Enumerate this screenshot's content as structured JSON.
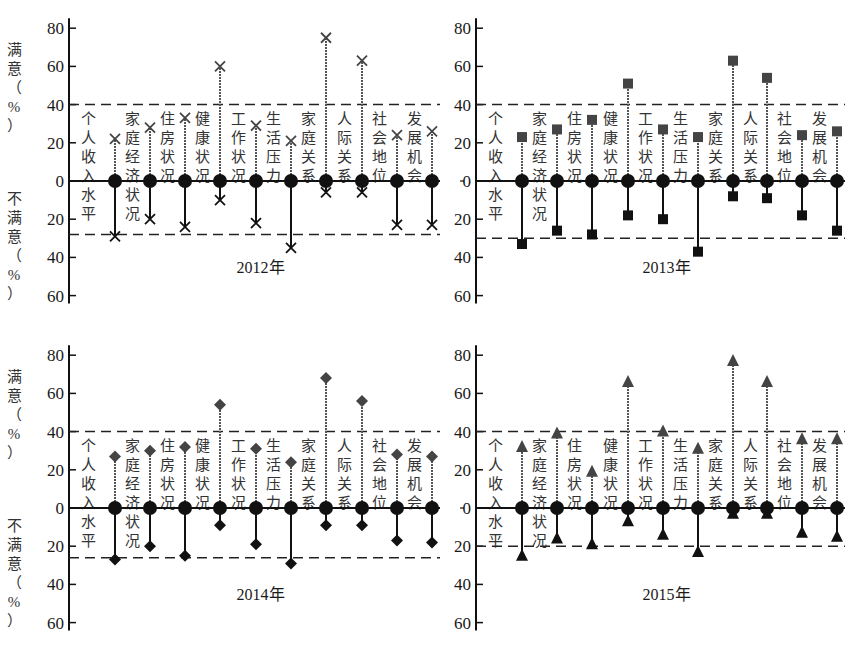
{
  "figure": {
    "colors": {
      "axis": "#111111",
      "satisfied_marker": "#444444",
      "satisfied_stem": "#555555",
      "dissatisfied_marker": "#111111",
      "dissatisfied_stem": "#111111",
      "dashed": "#222222",
      "text": "#1a1a1a"
    },
    "y_label_satisfied": [
      "满",
      "意",
      "（",
      "%",
      "）"
    ],
    "y_label_dissatisfied": [
      "不",
      "满",
      "意",
      "（",
      "%",
      "）"
    ]
  },
  "chart_data": [
    {
      "type": "bar",
      "subtype": "diverging-lollipop",
      "title": "2012年",
      "marker": "x",
      "categories": [
        "个人收入水平",
        "家庭经济状况",
        "住房状况",
        "健康状况",
        "工作状况",
        "生活压力",
        "家庭关系",
        "人际关系",
        "社会地位",
        "发展机会"
      ],
      "series": [
        {
          "name": "满意（%）",
          "values": [
            22,
            28,
            33,
            60,
            29,
            21,
            75,
            63,
            24,
            26
          ]
        },
        {
          "name": "不满意（%）",
          "values": [
            29,
            20,
            24,
            10,
            22,
            35,
            6,
            6,
            23,
            23
          ]
        }
      ],
      "reference_lines": {
        "satisfied": 40,
        "dissatisfied": 28
      },
      "ylabel_top": "满意（%）",
      "ylabel_bottom": "不满意（%）",
      "ylim_top": [
        0,
        80
      ],
      "ylim_bottom": [
        0,
        60
      ],
      "yticks": [
        80,
        60,
        40,
        20,
        0,
        20,
        40,
        60
      ],
      "grid": false
    },
    {
      "type": "bar",
      "subtype": "diverging-lollipop",
      "title": "2013年",
      "marker": "square",
      "categories": [
        "个人收入水平",
        "家庭经济状况",
        "住房状况",
        "健康状况",
        "工作状况",
        "生活压力",
        "家庭关系",
        "人际关系",
        "社会地位",
        "发展机会"
      ],
      "series": [
        {
          "name": "满意（%）",
          "values": [
            23,
            27,
            32,
            51,
            27,
            23,
            63,
            54,
            24,
            26
          ]
        },
        {
          "name": "不满意（%）",
          "values": [
            33,
            26,
            28,
            18,
            20,
            37,
            8,
            9,
            18,
            26
          ]
        }
      ],
      "reference_lines": {
        "satisfied": 40,
        "dissatisfied": 30
      },
      "ylim_top": [
        0,
        80
      ],
      "ylim_bottom": [
        0,
        60
      ],
      "yticks": [
        80,
        60,
        40,
        20,
        0,
        20,
        40,
        60
      ],
      "grid": false
    },
    {
      "type": "bar",
      "subtype": "diverging-lollipop",
      "title": "2014年",
      "marker": "diamond",
      "categories": [
        "个人收入水平",
        "家庭经济状况",
        "住房状况",
        "健康状况",
        "工作状况",
        "生活压力",
        "家庭关系",
        "人际关系",
        "社会地位",
        "发展机会"
      ],
      "series": [
        {
          "name": "满意（%）",
          "values": [
            27,
            30,
            32,
            54,
            31,
            24,
            68,
            56,
            28,
            27
          ]
        },
        {
          "name": "不满意（%）",
          "values": [
            27,
            20,
            25,
            9,
            19,
            29,
            9,
            9,
            17,
            18
          ]
        }
      ],
      "reference_lines": {
        "satisfied": 40,
        "dissatisfied": 26
      },
      "ylabel_top": "满意（%）",
      "ylabel_bottom": "不满意（%）",
      "ylim_top": [
        0,
        80
      ],
      "ylim_bottom": [
        0,
        60
      ],
      "yticks": [
        80,
        60,
        40,
        20,
        0,
        20,
        40,
        60
      ],
      "grid": false
    },
    {
      "type": "bar",
      "subtype": "diverging-lollipop",
      "title": "2015年",
      "marker": "triangle",
      "categories": [
        "个人收入水平",
        "家庭经济状况",
        "住房状况",
        "健康状况",
        "工作状况",
        "生活压力",
        "家庭关系",
        "人际关系",
        "社会地位",
        "发展机会"
      ],
      "series": [
        {
          "name": "满意（%）",
          "values": [
            32,
            39,
            19,
            66,
            40,
            31,
            77,
            66,
            36,
            36
          ]
        },
        {
          "name": "不满意（%）",
          "values": [
            25,
            16,
            19,
            7,
            14,
            23,
            3,
            3,
            13,
            15
          ]
        }
      ],
      "reference_lines": {
        "satisfied": 40,
        "dissatisfied": 20
      },
      "ylim_top": [
        0,
        80
      ],
      "ylim_bottom": [
        0,
        60
      ],
      "yticks": [
        80,
        60,
        40,
        20,
        0,
        20,
        40,
        60
      ],
      "grid": false
    }
  ]
}
